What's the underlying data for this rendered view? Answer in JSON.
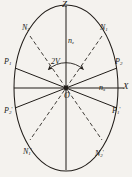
{
  "figure": {
    "kind": "optical-indicatrix-section",
    "title": "",
    "canvas": {
      "width": 132,
      "height": 177
    },
    "background_color": "#f4f2ee",
    "ink_color": "#201c18"
  },
  "geometry": {
    "center": {
      "x": 66,
      "y": 88,
      "label": "O"
    },
    "ellipse": {
      "cx": 66,
      "cy": 88,
      "rx": 52,
      "ry": 83
    },
    "axes": {
      "vertical": {
        "from_y": 6,
        "to_y": 170,
        "top_label": "Z"
      },
      "horizontal": {
        "from_x": 14,
        "to_x": 124,
        "right_label": "X"
      }
    }
  },
  "labels": {
    "axis_z": "Z",
    "axis_x": "X",
    "origin": "O",
    "index_z": {
      "base": "n",
      "sub": "z"
    },
    "index_x": {
      "base": "n",
      "sub": "x"
    },
    "angle": "2V",
    "optic_axis_1": {
      "base": "N",
      "sub": "1",
      "prime": ""
    },
    "optic_axis_2": {
      "base": "N",
      "sub": "2",
      "prime": ""
    },
    "optic_axis_1_prime": {
      "base": "N",
      "sub": "1",
      "prime": "'"
    },
    "optic_axis_2_prime": {
      "base": "N",
      "sub": "2",
      "prime": "'"
    },
    "plane_1": {
      "base": "P",
      "sub": "1",
      "prime": ""
    },
    "plane_2": {
      "base": "P",
      "sub": "2",
      "prime": ""
    },
    "plane_1_prime": {
      "base": "P",
      "sub": "1",
      "prime": "'"
    },
    "plane_2_prime": {
      "base": "P",
      "sub": "2",
      "prime": "'"
    }
  },
  "lines": {
    "dashed_optic_axes": [
      {
        "name": "N2-N2'",
        "x1": 30,
        "y1": 36,
        "x2": 102,
        "y2": 140
      },
      {
        "name": "N1-N1'",
        "x1": 102,
        "y1": 36,
        "x2": 30,
        "y2": 140
      }
    ],
    "solid_vibration_planes": [
      {
        "name": "P1-P1'",
        "x1": 15,
        "y1": 68,
        "x2": 117,
        "y2": 108
      },
      {
        "name": "P2-P2'",
        "x1": 117,
        "y1": 68,
        "x2": 15,
        "y2": 108
      }
    ]
  },
  "annotations": {
    "arc_angle_label": "2V",
    "arc_description": "double-headed arc spanning the acute angle between the two optic axes at the origin"
  }
}
